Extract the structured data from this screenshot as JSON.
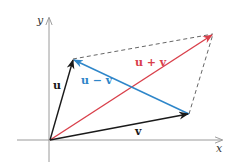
{
  "diagram": {
    "axes": {
      "x_label": "x",
      "y_label": "y",
      "color": "#9a9a9a"
    },
    "origin": [
      50,
      140
    ],
    "vectors": [
      {
        "id": "u",
        "label": "u",
        "from": [
          50,
          140
        ],
        "to": [
          73,
          59
        ],
        "color": "#1a1a1a"
      },
      {
        "id": "v",
        "label": "v",
        "from": [
          50,
          140
        ],
        "to": [
          189,
          114
        ],
        "color": "#1a1a1a"
      },
      {
        "id": "u_plus_v",
        "label": "u + v",
        "from": [
          50,
          140
        ],
        "to": [
          213,
          34
        ],
        "color": "#d9404b"
      },
      {
        "id": "u_minus_v",
        "label": "u − v",
        "from": [
          189,
          114
        ],
        "to": [
          73,
          59
        ],
        "color": "#2e86c9"
      }
    ],
    "dashed_edges": [
      {
        "from": [
          73,
          59
        ],
        "to": [
          213,
          34
        ]
      },
      {
        "from": [
          189,
          114
        ],
        "to": [
          213,
          34
        ]
      }
    ],
    "colors": {
      "black_vector": "#1a1a1a",
      "sum_vector": "#d9404b",
      "diff_vector": "#2e86c9",
      "dashed": "#555555",
      "axis": "#9a9a9a"
    }
  }
}
